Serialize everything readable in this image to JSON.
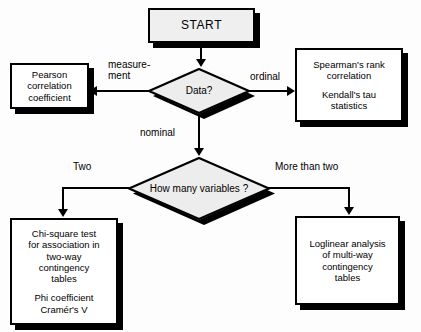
{
  "diagram": {
    "colors": {
      "node_fill": "#ffffff",
      "terminal_fill": "#efefef",
      "decision_fill": "#ededed",
      "stroke": "#000000",
      "shadow": "#000000",
      "background": "#fdfdfd"
    },
    "nodes": {
      "start": {
        "label": "START",
        "shape": "terminal"
      },
      "data_decision": {
        "label": "Data?",
        "shape": "decision"
      },
      "variables_decision": {
        "line1": "How many",
        "line2": "variables ?",
        "shape": "decision"
      },
      "pearson": {
        "line1": "Pearson",
        "line2": "correlation",
        "line3": "coefficient",
        "shape": "process"
      },
      "spearman": {
        "line1": "Spearman's rank",
        "line2": "correlation",
        "line3": "Kendall's tau",
        "line4": "statistics",
        "shape": "process"
      },
      "chi_square": {
        "line1": "Chi-square test",
        "line2": "for association in",
        "line3": "two-way",
        "line4": "contingency",
        "line5": "tables",
        "line6": "Phi coefficient",
        "line7": "Cramér's V",
        "shape": "process"
      },
      "loglinear": {
        "line1": "Loglinear analysis",
        "line2": "of multi-way",
        "line3": "contingency",
        "line4": "tables",
        "shape": "process"
      }
    },
    "edge_labels": {
      "measurement": "measure-\nment",
      "ordinal": "ordinal",
      "nominal": "nominal",
      "two": "Two",
      "more_than_two": "More than two"
    }
  }
}
